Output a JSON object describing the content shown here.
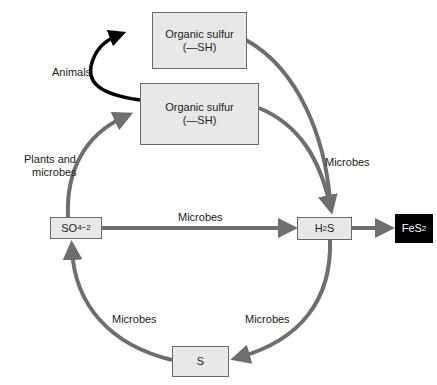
{
  "diagram": {
    "colors": {
      "arrow": "#6e6e6e",
      "animals_arrow": "#000000",
      "box_fill": "#e8e8e8",
      "box_border": "#6a6a6a",
      "dark_box": "#000000"
    },
    "nodes": {
      "organic_top": {
        "line1": "Organic sulfur",
        "line2": "(—SH)"
      },
      "organic_mid": {
        "line1": "Organic sulfur",
        "line2": "(—SH)"
      },
      "sulfate": {
        "base": "SO",
        "sub": "4",
        "sup": "−2"
      },
      "h2s": {
        "pre": "H",
        "sub": "2",
        "post": "S"
      },
      "fes2": {
        "base": "FeS",
        "sub": "2"
      },
      "sulfur": {
        "label": "S"
      }
    },
    "edge_labels": {
      "animals": "Animals",
      "plants_line1": "Plants and",
      "plants_line2": "microbes",
      "organic_to_h2s": "Microbes",
      "sulfate_to_h2s": "Microbes",
      "h2s_to_s": "Microbes",
      "s_to_sulfate": "Microbes"
    }
  }
}
